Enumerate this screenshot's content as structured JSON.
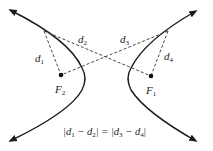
{
  "diagram": {
    "foci": [
      {
        "id": "F1",
        "label": "F",
        "subscript": "1"
      },
      {
        "id": "F2",
        "label": "F",
        "subscript": "2"
      }
    ],
    "distances": [
      {
        "id": "d1",
        "label": "d",
        "subscript": "1",
        "from": "P_left",
        "to": "F2"
      },
      {
        "id": "d2",
        "label": "d",
        "subscript": "2",
        "from": "P_left",
        "to": "F1"
      },
      {
        "id": "d3",
        "label": "d",
        "subscript": "3",
        "from": "P_right",
        "to": "F2"
      },
      {
        "id": "d4",
        "label": "d",
        "subscript": "4",
        "from": "P_right",
        "to": "F1"
      }
    ],
    "equation": {
      "left": "|d",
      "left_sub1": "1",
      "minus1": " − d",
      "left_sub2": "2",
      "mid": "| = |d",
      "right_sub1": "3",
      "minus2": " − d",
      "right_sub2": "4",
      "end": "|"
    },
    "colors": {
      "curve": "#1a1a1a",
      "dashed": "#333333",
      "text": "#222222"
    }
  }
}
